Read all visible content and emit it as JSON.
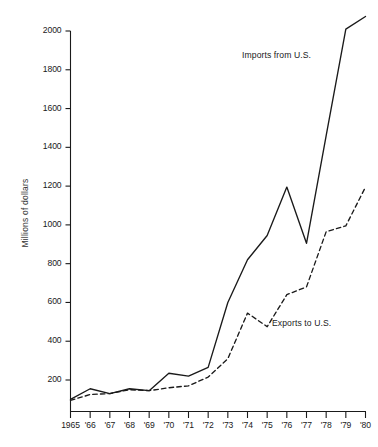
{
  "chart_data": {
    "type": "line",
    "title": "",
    "xlabel": "",
    "ylabel": "Millions of dollars",
    "x": [
      1965,
      1966,
      1967,
      1968,
      1969,
      1970,
      1971,
      1972,
      1973,
      1974,
      1975,
      1976,
      1977,
      1978,
      1979,
      1980
    ],
    "categories": [
      "1965",
      "'66",
      "'67",
      "'68",
      "'69",
      "'70",
      "'71",
      "'72",
      "'73",
      "'74",
      "'75",
      "'76",
      "'77",
      "'78",
      "'79",
      "'80"
    ],
    "xtick_labels": [
      "1965",
      "'66",
      "'67",
      "'68",
      "'69",
      "'70",
      "'71",
      "'72",
      "'73",
      "'74",
      "'75",
      "'76",
      "'77",
      "'78",
      "'79",
      "'80"
    ],
    "ytick_labels": [
      "2000",
      "1800",
      "1600",
      "1400",
      "1200",
      "1000",
      "800",
      "600",
      "400",
      "200"
    ],
    "yticks": [
      2000,
      1800,
      1600,
      1400,
      1200,
      1000,
      800,
      600,
      400,
      200
    ],
    "ylim": [
      0,
      2100
    ],
    "xlim": [
      1965,
      1980
    ],
    "grid": false,
    "legend_position": "inline-annotation",
    "series": [
      {
        "name": "Imports from U.S.",
        "style": "solid",
        "color": "#1a1a1a",
        "values": [
          100,
          155,
          130,
          155,
          145,
          235,
          220,
          265,
          600,
          820,
          945,
          1195,
          905,
          1460,
          2010,
          2075
        ]
      },
      {
        "name": "Exports to U.S.",
        "style": "dashed",
        "color": "#1a1a1a",
        "values": [
          95,
          125,
          130,
          150,
          145,
          160,
          170,
          215,
          310,
          545,
          475,
          640,
          680,
          965,
          995,
          1195
        ]
      }
    ],
    "annotations": [
      {
        "text": "Imports from U.S.",
        "x_px": 242,
        "y_px": 50
      },
      {
        "text": "Exports to U.S.",
        "x_px": 272,
        "y_px": 318
      }
    ]
  },
  "axis": {
    "y_title": "Millions of dollars"
  }
}
